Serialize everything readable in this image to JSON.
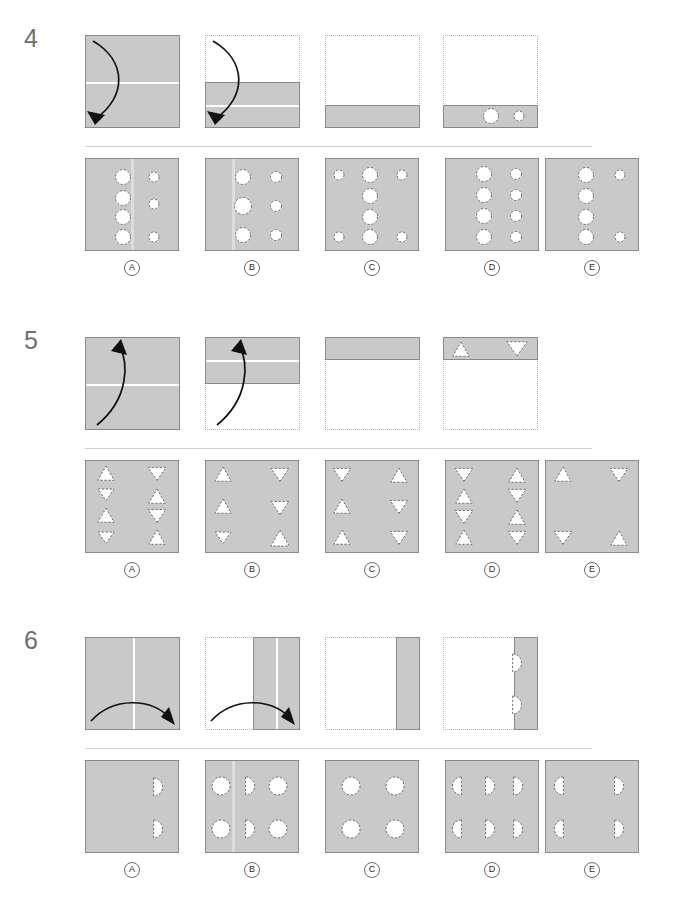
{
  "test": {
    "kind": "paper-folding-reasoning-items",
    "option_letters": [
      "A",
      "B",
      "C",
      "D",
      "E"
    ]
  },
  "questions": [
    {
      "number": "4",
      "punch_shape": "circle",
      "sequence": [
        {
          "name": "step-1-full-square-horizontal-crease",
          "paper": "full",
          "creases": [
            "horizontal-middle"
          ],
          "arrow": "down-left-curve",
          "ghost": false
        },
        {
          "name": "step-2-folded-bottom-half",
          "paper": "bottom-half",
          "creases": [
            "horizontal-middle-of-half"
          ],
          "arrow": "down-left-curve",
          "ghost": true
        },
        {
          "name": "step-3-folded-bottom-quarter",
          "paper": "bottom-quarter",
          "creases": [],
          "arrow": "none",
          "ghost": true
        },
        {
          "name": "step-4-punched-bottom-quarter",
          "paper": "bottom-quarter",
          "creases": [],
          "arrow": "none",
          "ghost": true,
          "punches": [
            {
              "cx": 48,
              "cy": 81,
              "r": 7.5,
              "shape": "circle"
            },
            {
              "cx": 76,
              "cy": 81,
              "r": 5.0,
              "shape": "circle"
            }
          ]
        }
      ],
      "options": [
        {
          "letter": "A",
          "punches": [
            {
              "cx": 37,
              "cy": 18,
              "r": 7.5
            },
            {
              "cx": 68,
              "cy": 18,
              "r": 5.0
            },
            {
              "cx": 37,
              "cy": 39,
              "r": 7.5
            },
            {
              "cx": 68,
              "cy": 45,
              "r": 5.0
            },
            {
              "cx": 37,
              "cy": 58,
              "r": 7.5
            },
            {
              "cx": 37,
              "cy": 78,
              "r": 7.5
            },
            {
              "cx": 68,
              "cy": 78,
              "r": 5.0
            }
          ],
          "tints": [
            "vertical-center"
          ]
        },
        {
          "letter": "B",
          "punches": [
            {
              "cx": 37,
              "cy": 18,
              "r": 7.5
            },
            {
              "cx": 70,
              "cy": 18,
              "r": 5.5
            },
            {
              "cx": 37,
              "cy": 47,
              "r": 8.5
            },
            {
              "cx": 70,
              "cy": 47,
              "r": 5.5
            },
            {
              "cx": 37,
              "cy": 76,
              "r": 7.5
            },
            {
              "cx": 70,
              "cy": 76,
              "r": 5.5
            }
          ],
          "tints": [
            "vertical-left"
          ]
        },
        {
          "letter": "C",
          "punches": [
            {
              "cx": 13,
              "cy": 16,
              "r": 5.0
            },
            {
              "cx": 44,
              "cy": 16,
              "r": 7.5
            },
            {
              "cx": 76,
              "cy": 16,
              "r": 5.0
            },
            {
              "cx": 44,
              "cy": 37,
              "r": 7.5
            },
            {
              "cx": 44,
              "cy": 58,
              "r": 7.5
            },
            {
              "cx": 13,
              "cy": 78,
              "r": 5.0
            },
            {
              "cx": 44,
              "cy": 78,
              "r": 7.5
            },
            {
              "cx": 76,
              "cy": 78,
              "r": 5.0
            }
          ],
          "tints": []
        },
        {
          "letter": "D",
          "punches": [
            {
              "cx": 38,
              "cy": 15,
              "r": 7.5
            },
            {
              "cx": 70,
              "cy": 15,
              "r": 5.5
            },
            {
              "cx": 38,
              "cy": 36,
              "r": 7.5
            },
            {
              "cx": 70,
              "cy": 36,
              "r": 5.5
            },
            {
              "cx": 38,
              "cy": 57,
              "r": 7.5
            },
            {
              "cx": 70,
              "cy": 57,
              "r": 5.5
            },
            {
              "cx": 38,
              "cy": 78,
              "r": 7.5
            },
            {
              "cx": 70,
              "cy": 78,
              "r": 5.5
            }
          ],
          "tints": []
        },
        {
          "letter": "E",
          "punches": [
            {
              "cx": 40,
              "cy": 16,
              "r": 7.5
            },
            {
              "cx": 74,
              "cy": 16,
              "r": 5.0
            },
            {
              "cx": 40,
              "cy": 37,
              "r": 7.5
            },
            {
              "cx": 40,
              "cy": 58,
              "r": 7.5
            },
            {
              "cx": 40,
              "cy": 78,
              "r": 7.5
            },
            {
              "cx": 74,
              "cy": 78,
              "r": 5.0
            }
          ],
          "tints": []
        }
      ]
    },
    {
      "number": "5",
      "punch_shape": "triangle",
      "sequence": [
        {
          "name": "step-1-full-square-horizontal-crease",
          "paper": "full",
          "creases": [
            "horizontal-middle"
          ],
          "arrow": "up-right-curve",
          "ghost": false
        },
        {
          "name": "step-2-folded-top-half",
          "paper": "top-half",
          "creases": [
            "horizontal-middle-of-half"
          ],
          "arrow": "up-right-curve",
          "ghost": true
        },
        {
          "name": "step-3-folded-top-quarter",
          "paper": "top-quarter",
          "creases": [],
          "arrow": "none",
          "ghost": true
        },
        {
          "name": "step-4-punched-top-quarter",
          "paper": "top-quarter",
          "creases": [],
          "arrow": "none",
          "ghost": true,
          "punches": [
            {
              "cx": 18,
              "cy": 13,
              "r": 8,
              "shape": "triangle-up"
            },
            {
              "cx": 74,
              "cy": 11,
              "r": 10,
              "shape": "triangle-down"
            }
          ]
        }
      ],
      "options": [
        {
          "letter": "A",
          "punches": [
            {
              "cx": 20,
              "cy": 13,
              "r": 8,
              "shape": "triangle-up"
            },
            {
              "cx": 71,
              "cy": 12,
              "r": 9,
              "shape": "triangle-down"
            },
            {
              "cx": 20,
              "cy": 33,
              "r": 8,
              "shape": "triangle-down"
            },
            {
              "cx": 71,
              "cy": 36,
              "r": 8,
              "shape": "triangle-up"
            },
            {
              "cx": 20,
              "cy": 55,
              "r": 8,
              "shape": "triangle-up"
            },
            {
              "cx": 71,
              "cy": 54,
              "r": 9,
              "shape": "triangle-down"
            },
            {
              "cx": 20,
              "cy": 76,
              "r": 8,
              "shape": "triangle-down"
            },
            {
              "cx": 71,
              "cy": 77,
              "r": 8,
              "shape": "triangle-up"
            }
          ],
          "tints": []
        },
        {
          "letter": "B",
          "punches": [
            {
              "cx": 17,
              "cy": 14,
              "r": 8,
              "shape": "triangle-up"
            },
            {
              "cx": 74,
              "cy": 13,
              "r": 9,
              "shape": "triangle-down"
            },
            {
              "cx": 17,
              "cy": 46,
              "r": 8,
              "shape": "triangle-up"
            },
            {
              "cx": 74,
              "cy": 46,
              "r": 9,
              "shape": "triangle-down"
            },
            {
              "cx": 17,
              "cy": 76,
              "r": 8,
              "shape": "triangle-down"
            },
            {
              "cx": 74,
              "cy": 78,
              "r": 9,
              "shape": "triangle-up"
            }
          ],
          "tints": []
        },
        {
          "letter": "C",
          "punches": [
            {
              "cx": 16,
              "cy": 13,
              "r": 9,
              "shape": "triangle-down"
            },
            {
              "cx": 73,
              "cy": 15,
              "r": 8,
              "shape": "triangle-up"
            },
            {
              "cx": 16,
              "cy": 46,
              "r": 8,
              "shape": "triangle-up"
            },
            {
              "cx": 73,
              "cy": 45,
              "r": 9,
              "shape": "triangle-down"
            },
            {
              "cx": 16,
              "cy": 77,
              "r": 8,
              "shape": "triangle-up"
            },
            {
              "cx": 73,
              "cy": 76,
              "r": 9,
              "shape": "triangle-down"
            }
          ],
          "tints": []
        },
        {
          "letter": "D",
          "punches": [
            {
              "cx": 18,
              "cy": 13,
              "r": 9,
              "shape": "triangle-down"
            },
            {
              "cx": 71,
              "cy": 15,
              "r": 8,
              "shape": "triangle-up"
            },
            {
              "cx": 18,
              "cy": 36,
              "r": 8,
              "shape": "triangle-up"
            },
            {
              "cx": 71,
              "cy": 34,
              "r": 9,
              "shape": "triangle-down"
            },
            {
              "cx": 18,
              "cy": 55,
              "r": 9,
              "shape": "triangle-down"
            },
            {
              "cx": 71,
              "cy": 57,
              "r": 8,
              "shape": "triangle-up"
            },
            {
              "cx": 18,
              "cy": 77,
              "r": 8,
              "shape": "triangle-up"
            },
            {
              "cx": 71,
              "cy": 76,
              "r": 9,
              "shape": "triangle-down"
            }
          ],
          "tints": []
        },
        {
          "letter": "E",
          "punches": [
            {
              "cx": 17,
              "cy": 14,
              "r": 8,
              "shape": "triangle-up"
            },
            {
              "cx": 73,
              "cy": 13,
              "r": 9,
              "shape": "triangle-down"
            },
            {
              "cx": 17,
              "cy": 76,
              "r": 9,
              "shape": "triangle-down"
            },
            {
              "cx": 73,
              "cy": 78,
              "r": 8,
              "shape": "triangle-up"
            }
          ],
          "tints": []
        }
      ]
    },
    {
      "number": "6",
      "punch_shape": "half-circle",
      "sequence": [
        {
          "name": "step-1-full-square-vertical-crease",
          "paper": "full",
          "creases": [
            "vertical-middle"
          ],
          "arrow": "right-arc",
          "ghost": false
        },
        {
          "name": "step-2-folded-right-half",
          "paper": "right-half",
          "creases": [
            "vertical-middle-of-half"
          ],
          "arrow": "right-arc",
          "ghost": true
        },
        {
          "name": "step-3-folded-right-quarter",
          "paper": "right-quarter",
          "creases": [],
          "arrow": "none",
          "ghost": true
        },
        {
          "name": "step-4-punched-right-quarter",
          "paper": "right-quarter",
          "creases": [],
          "arrow": "none",
          "ghost": true,
          "punches": [
            {
              "cx": 71,
              "cy": 26,
              "r": 9,
              "shape": "half-circle-right"
            },
            {
              "cx": 71,
              "cy": 68,
              "r": 9,
              "shape": "half-circle-right"
            }
          ]
        }
      ],
      "options": [
        {
          "letter": "A",
          "punches": [
            {
              "cx": 69,
              "cy": 26,
              "r": 9,
              "shape": "half-circle-right"
            },
            {
              "cx": 69,
              "cy": 68,
              "r": 9,
              "shape": "half-circle-right"
            }
          ],
          "tints": []
        },
        {
          "letter": "B",
          "punches": [
            {
              "cx": 15,
              "cy": 25,
              "r": 9,
              "shape": "circle"
            },
            {
              "cx": 41,
              "cy": 25,
              "r": 9,
              "shape": "half-circle-right"
            },
            {
              "cx": 72,
              "cy": 25,
              "r": 9,
              "shape": "circle"
            },
            {
              "cx": 15,
              "cy": 68,
              "r": 9,
              "shape": "circle"
            },
            {
              "cx": 41,
              "cy": 68,
              "r": 9,
              "shape": "half-circle-right"
            },
            {
              "cx": 72,
              "cy": 68,
              "r": 9,
              "shape": "circle"
            }
          ],
          "tints": [
            "vertical-left"
          ]
        },
        {
          "letter": "C",
          "punches": [
            {
              "cx": 25,
              "cy": 25,
              "r": 9,
              "shape": "circle"
            },
            {
              "cx": 69,
              "cy": 25,
              "r": 9,
              "shape": "circle"
            },
            {
              "cx": 25,
              "cy": 68,
              "r": 9,
              "shape": "circle"
            },
            {
              "cx": 69,
              "cy": 68,
              "r": 9,
              "shape": "circle"
            }
          ],
          "tints": []
        },
        {
          "letter": "D",
          "punches": [
            {
              "cx": 14,
              "cy": 25,
              "r": 9,
              "shape": "half-circle-left"
            },
            {
              "cx": 41,
              "cy": 25,
              "r": 9,
              "shape": "half-circle-right"
            },
            {
              "cx": 69,
              "cy": 25,
              "r": 9,
              "shape": "half-circle-right"
            },
            {
              "cx": 14,
              "cy": 68,
              "r": 9,
              "shape": "half-circle-left"
            },
            {
              "cx": 41,
              "cy": 68,
              "r": 9,
              "shape": "half-circle-right"
            },
            {
              "cx": 69,
              "cy": 68,
              "r": 9,
              "shape": "half-circle-right"
            }
          ],
          "tints": []
        },
        {
          "letter": "E",
          "punches": [
            {
              "cx": 16,
              "cy": 25,
              "r": 9,
              "shape": "half-circle-left"
            },
            {
              "cx": 70,
              "cy": 25,
              "r": 9,
              "shape": "half-circle-right"
            },
            {
              "cx": 16,
              "cy": 68,
              "r": 9,
              "shape": "half-circle-left"
            },
            {
              "cx": 70,
              "cy": 68,
              "r": 9,
              "shape": "half-circle-right"
            }
          ],
          "tints": []
        }
      ]
    }
  ],
  "colors": {
    "paper_fill": "#c9c9c9",
    "paper_border": "#8a8a8a",
    "ghost_border": "#b4b4b4",
    "hole_fill": "#ffffff",
    "hole_dash": "#6e6e6e",
    "qnum_color": "#6e6e6e",
    "divider": "#d2d2d2",
    "page_bg": "#ffffff"
  }
}
